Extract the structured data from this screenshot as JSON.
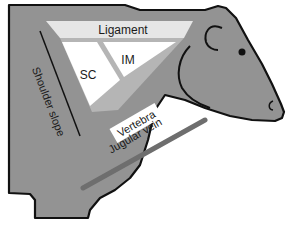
{
  "figure": {
    "labels": {
      "ligament": "Ligament",
      "sc": "SC",
      "im": "IM",
      "vertebra": "Vertebra",
      "shoulder_slope": "Shoulder slope",
      "jugular_vein": "Jugular vein"
    },
    "colors": {
      "body_fill": "#939393",
      "outline": "#111111",
      "ligament_band": "#e6e6e6",
      "muscle_region": "#ffffff",
      "separator": "#b5b5b5",
      "jugular_vein": "#6e6e6e",
      "background": "#ffffff"
    }
  },
  "caption": {
    "text": "",
    "note": "caption cut off at bottom edge"
  }
}
